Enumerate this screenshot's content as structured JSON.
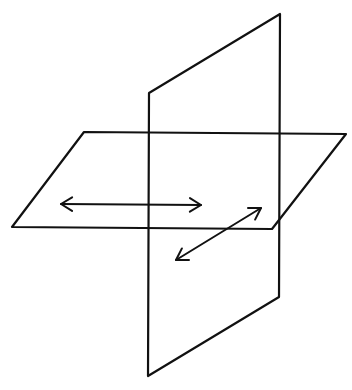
{
  "diagram": {
    "title": "",
    "stroke_color": "#111111",
    "background_color": "#ffffff",
    "vertical_plane": {
      "vertices": [
        [
          149,
          93
        ],
        [
          280,
          14
        ],
        [
          279,
          297
        ],
        [
          148,
          376
        ]
      ]
    },
    "horizontal_plane": {
      "vertices": [
        [
          84,
          132
        ],
        [
          346,
          134
        ],
        [
          272,
          229
        ],
        [
          12,
          227
        ]
      ]
    },
    "arrows": [
      {
        "name": "horizontal-double-arrow",
        "from": [
          61,
          204
        ],
        "to": [
          201,
          205
        ]
      },
      {
        "name": "diagonal-double-arrow",
        "from": [
          176,
          260
        ],
        "to": [
          261,
          208
        ]
      }
    ],
    "labels": []
  }
}
